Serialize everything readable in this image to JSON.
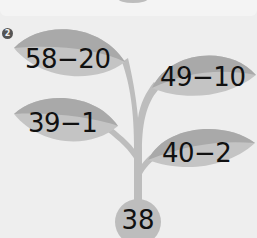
{
  "problem": {
    "number_badge": "2",
    "leaves": [
      {
        "position": "top-left",
        "expression": "58−20"
      },
      {
        "position": "top-right",
        "expression": "49−10"
      },
      {
        "position": "bottom-left",
        "expression": "39−1"
      },
      {
        "position": "bottom-right",
        "expression": "40−2"
      }
    ],
    "root": {
      "value": "38"
    }
  },
  "colors": {
    "background": "#eeeeee",
    "leaf_dark": "#a9a9a9",
    "leaf_light": "#c4c4c4",
    "stem": "#bdbdbd",
    "text": "#111111"
  }
}
